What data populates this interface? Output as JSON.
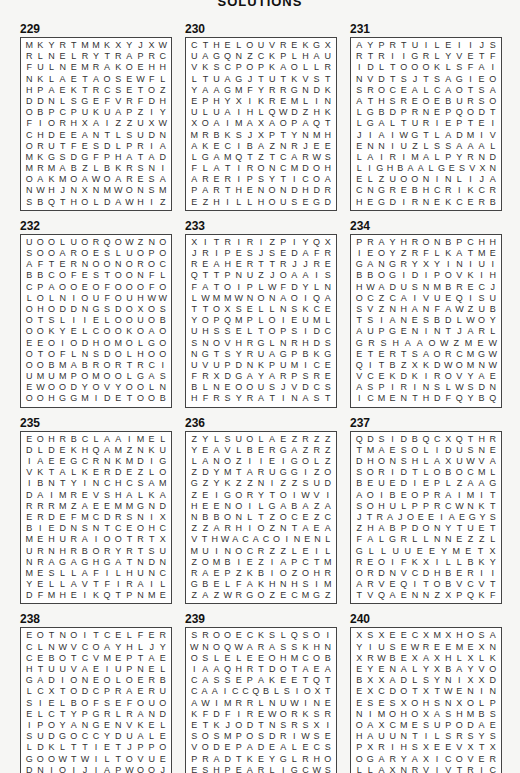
{
  "header": {
    "title": "SOLUTIONS"
  },
  "puzzles": [
    {
      "number": "229",
      "rows": [
        "MKYRTMMKXYJXW",
        "RLNELRYTRAPRC",
        "FULNEMRAKOEHH",
        "NKLAETAOSEWFL",
        "HPAEKTRCSETOZ",
        "DDNLSGEFVRFDH",
        "OBPCPUKUAPZIY",
        "FIORHXAIZZUXW",
        "CHDEEANTLSUDN",
        "ORUTFESDLPRIA",
        "MKGSDGFPHATAD",
        "MRMABZLBKRSNI",
        "OAKMOAWOARESA",
        "NWHJNXNMWONSM",
        "SBQTHOLDAWHIZ"
      ]
    },
    {
      "number": "230",
      "rows": [
        "CTHELOUVREKGX",
        "UAGQNZCKPLHAU",
        "VKSCPOPKAOLLR",
        "LTUAGJTUTKVST",
        "YAAGMFYRRGNDK",
        "EPHYXIKREMLIN",
        "ULUAIHLQWDZHK",
        "XOAIMAXAOPAQT",
        "MRBKSJXPTYNMH",
        "AKECIBAZNRJEE",
        "LGAMQTZTCARWS",
        "FLATIRONCMDOH",
        "ARERIPSYTICOA",
        "PARTHENONDHDR",
        "EZHILLHOUSEGD"
      ]
    },
    {
      "number": "231",
      "rows": [
        "AYPRTUILEIIJS",
        "RTRIIGRLYVETF",
        "IDLTOOOKLSFAI",
        "NVDTSJTSAGIEO",
        "SROCEALCAOTSA",
        "ATHSREOEBURSO",
        "LGBDPRNEPQODT",
        "LGALTURIEPTEI",
        "JIAIWGTLADMIV",
        "ENNIUZLSSAAAL",
        "LAIRIMALPYRND",
        "LIGHBAALGESVXN",
        "ELZUOONINLIJA",
        "CNGREBHCRIKCR",
        "HEGDIRNEKCERB"
      ]
    },
    {
      "number": "232",
      "rows": [
        "UOOLUORQOWZNO",
        "SOOAROESLUOPO",
        "AFTERNOONOROC",
        "BBCOFESTOONFL",
        "CPAOOEOFOOOFO",
        "LOLNIOUFOUHWW",
        "OHODDNGSDOXOS",
        "OTSLIIELOOUOB",
        "OOKYELCOOKOAO",
        "EEOIODHOMOLGO",
        "OTOFLNSDOLHOO",
        "OOBMABRORTRCI",
        "UMUMPOMOOLGAS",
        "EWOODYOVYOOLN",
        "OOHGGMIDETOOB"
      ]
    },
    {
      "number": "233",
      "rows": [
        "XITRIRIZPIYQX",
        "JRIPESJSEDAFR",
        "REAHERTTRJJRE",
        "QTTPNUZJOAAIS",
        "FATOIPLWFDYLN",
        "LWMMWNONAOIQA",
        "TTOXSELLNSKCE",
        "YOPQMPLOIEUML",
        "UHSSELTOPSIDC",
        "SNOVHRGLNRHDS",
        "NGTSYRUAGPBKG",
        "UVUPDNKPUMICE",
        "FRXDGAYARPSRE",
        "BLNEOOUSJVDCS",
        "HFRSYRATINAST"
      ]
    },
    {
      "number": "234",
      "rows": [
        "PRAYHRONBPCHH",
        "IEOYZRFLKATME",
        "GANGRYXYINIUI",
        "BBOGIDIPOVKIH",
        "HWADUSNMBRECJ",
        "OCZCAIVUEQISU",
        "SVZNHANFAWZUB",
        "TSIANESBDLWOY",
        "AUPGENINTJARL",
        "GRSHAAOWZMEW",
        "ETERTSAORCMGW",
        "QITBZXKDWOMNW",
        "VCEKDKIROVYAE",
        "ASPIRINSLWSDN",
        "ICMENTHDFQYBQ"
      ]
    },
    {
      "number": "235",
      "rows": [
        "EOHRBCLAAIMEL",
        "DLDEKHQAMZNKU",
        "IAEEGCRNKMDIG",
        "VKTALKERDEZLO",
        "IBNTYINCHCSAM",
        "DAIMREVSHALKA",
        "RRRMZAEEMMGND",
        "ERDEFMCDRSNIX",
        "BIEDNSNTCEOHC",
        "MEHURAIOOTRTX",
        "URNHRBORYRTSU",
        "NRAGAGHGATNDN",
        "MESLLAFILHUNC",
        "YELLAVTFIRAIL",
        "DFMHEIKQTPNME"
      ]
    },
    {
      "number": "236",
      "rows": [
        "ZYLSUOLAEZRZZ",
        "YEAVLBERGAZRZ",
        "LANOZIIEIGOLZ",
        "ZDYMTARUGGIZO",
        "GZYKZZNIZZSUD",
        "ZEIGORYTOIWVI",
        "HEENOILGABAZA",
        "NBBONLTZOCEZC",
        "ZZARHIOZNTAEA",
        "VTHWACACOINENL",
        "MUINOCRZZLEIL",
        "ZOMBIEZIAPCTM",
        "RAEPZKBIOZOHR",
        "GBELFAKHNHSIM",
        "ZAZWRGOZECMGZ"
      ]
    },
    {
      "number": "237",
      "rows": [
        "QDSIDBQCXQTHR",
        "TMAESOLIDUSNE",
        "DHONSHLAXUWVA",
        "SORIDTLOBOCML",
        "BEUEDIEPLZAAG",
        "AOIBEOPRAIMIT",
        "SOHULPPRCWNKT",
        "JTRAJOEEIAEGYS",
        "ZHABPDONYTUET",
        "FALGRLLNNEZZL",
        "GLLUUEEYMETX",
        "REOIFKXILLBKY",
        "ORDNVCDHBERII",
        "ARVEQITOBVCVT",
        "TVQAENNZXPQKF"
      ]
    },
    {
      "number": "238",
      "rows": [
        "EOTNOITCELFER",
        "CLNWVCOAYHLJY",
        "CEBOTCVMEPTAE",
        "HTUUVAEIUPNEL",
        "GADIONEOLOERB",
        "LCXTODCPRAERU",
        "SIELBOFSEFOUO",
        "ELCTYPGRLRAND",
        "IPOYANGENVKEL",
        "SUDGOCCYDUALE",
        "LDKLTTIETJPPO",
        "GOOWTWILTOVUE",
        "DNIOIJIAPWQOJ",
        "ECNZMRENIUICO",
        "ETEIECIWTLDNI"
      ]
    },
    {
      "number": "239",
      "rows": [
        "SROOECKSLQSOI",
        "WNOQWARASSKHN",
        "OSLELEEOHMCOB",
        "IAAQHRTDOTAEA",
        "CASSEPAKEETQT",
        "CAAICCQBLSIOXT",
        "AWIMRRLNUWINE",
        "KFDFIREWORKSR",
        "ETKJODTNSRSXI",
        "SOSMPOSDRIWSE",
        "VODEPADEALECS",
        "PRADTKEYGLRHO",
        "ESHPEARLIGCWS",
        "NAUHUEDTCNSFB",
        "SJESTAERTGODP"
      ]
    },
    {
      "number": "240",
      "rows": [
        "XSXEECXMXHOSA",
        "YIUSEWREEMEXN",
        "XRWBEXAXHLXLK",
        "EYENALYXBAYVO",
        "BXXADLSYNIXXD",
        "EXCDOTXTWENIN",
        "ESESXOHSNXOLP",
        "NIMOHOXASHMBS",
        "OAXCMESUPODAE",
        "HAUUNTILSRSYS",
        "PXRIHSXEEVXTX",
        "OGARYAXICOVER",
        "LLAXNRVIVTRIC",
        "YOXDEANXSOZZS",
        "XINXXGESXENON"
      ]
    }
  ]
}
